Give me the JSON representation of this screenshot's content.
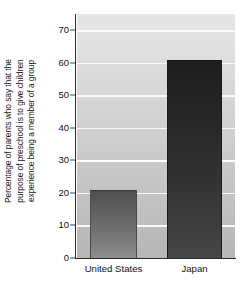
{
  "chart_data": {
    "type": "bar",
    "title": "",
    "subtitle": "",
    "categories": [
      "United States",
      "Japan"
    ],
    "values": [
      21,
      61
    ],
    "series": [
      {
        "name": "Percentage of parents",
        "values": [
          21,
          61
        ]
      }
    ],
    "xlabel": "",
    "ylabel_lines": [
      "Percentage of parents who say that the",
      "purpose of preschool is to give children",
      "experience being a member of a group"
    ],
    "ylabel": "Percentage of parents who say that the purpose of preschool is to give children experience being a member of a group",
    "ylim": [
      0,
      75
    ],
    "yticks": [
      0,
      10,
      20,
      30,
      40,
      50,
      60,
      70
    ],
    "ytick_labels": [
      "0",
      "10",
      "20",
      "30",
      "40",
      "50",
      "60",
      "70"
    ],
    "grid": true,
    "grid_axis": "y",
    "legend": false,
    "legend_position": "none",
    "colors": {
      "bar_united_states_top": "#4f4f4f",
      "bar_united_states_bottom": "#8e8e8e",
      "bar_japan_top": "#1d1d1d",
      "bar_japan_bottom": "#474747",
      "plot_background_top": "#e6e6e6",
      "plot_background_bottom": "#b6b6b5",
      "gridline": "#fbfbfb",
      "axis": "#2b2b2b",
      "text": "#111111",
      "figure_background": "#ffffff"
    }
  }
}
